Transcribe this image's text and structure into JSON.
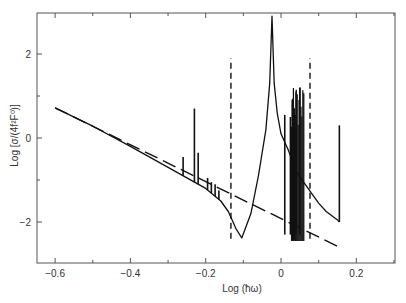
{
  "chart_data": {
    "type": "line",
    "title": "",
    "xlabel": "Log (ħω)",
    "ylabel": "Log [σ/(4f²F⁰)]",
    "xlim": [
      -0.65,
      0.3
    ],
    "ylim": [
      -3.0,
      3.0
    ],
    "x_ticks": [
      -0.6,
      -0.4,
      -0.2,
      0,
      0.2
    ],
    "x_tick_labels": [
      "−0.6",
      "−0.4",
      "−0.2",
      "0",
      "0.2"
    ],
    "y_ticks": [
      -2,
      0,
      2
    ],
    "y_tick_labels": [
      "−2",
      "0",
      "2"
    ],
    "grid": false,
    "legend": null,
    "series": [
      {
        "name": "cross-section (solid)",
        "style": "solid",
        "x": [
          -0.6,
          -0.5,
          -0.4,
          -0.3,
          -0.25,
          -0.2,
          -0.16,
          -0.14,
          -0.12,
          -0.104,
          -0.08,
          -0.06,
          -0.04,
          -0.03,
          -0.024,
          -0.018,
          -0.01,
          0.0,
          0.01,
          0.02,
          0.04,
          0.06,
          0.08,
          0.1,
          0.12,
          0.15,
          0.155
        ],
        "y": [
          0.72,
          0.28,
          -0.2,
          -0.7,
          -0.95,
          -1.2,
          -1.5,
          -1.75,
          -2.15,
          -2.38,
          -1.8,
          -0.9,
          0.2,
          1.3,
          2.9,
          1.3,
          0.6,
          0.1,
          -0.1,
          -0.3,
          -0.8,
          -1.05,
          -1.3,
          -1.55,
          -1.75,
          -1.95,
          -2.0
        ]
      },
      {
        "name": "power-law fit (long dash)",
        "style": "dashed",
        "x": [
          -0.6,
          0.155
        ],
        "y": [
          0.72,
          -2.6
        ]
      }
    ],
    "spikes": [
      {
        "x": -0.26,
        "y_top": -0.45
      },
      {
        "x": -0.23,
        "y_top": 0.7
      },
      {
        "x": -0.22,
        "y_top": -0.35
      },
      {
        "x": -0.195,
        "y_top": -0.95
      },
      {
        "x": -0.185,
        "y_top": -1.05
      },
      {
        "x": -0.175,
        "y_top": -1.1
      },
      {
        "x": -0.165,
        "y_top": -1.25
      },
      {
        "x": 0.01,
        "y_top": 0.55
      },
      {
        "x": 0.025,
        "y_top": 0.5
      },
      {
        "x": 0.03,
        "y_top": 0.9
      },
      {
        "x": 0.04,
        "y_top": 1.1
      },
      {
        "x": 0.05,
        "y_top": 1.2
      },
      {
        "x": 0.155,
        "y_top": 0.3
      }
    ],
    "annotations": [
      {
        "type": "vertical_dashed_line",
        "x": -0.133,
        "y_range": [
          -2.4,
          1.9
        ]
      },
      {
        "type": "vertical_dashed_line",
        "x": 0.077,
        "y_range": [
          -2.4,
          1.9
        ]
      }
    ]
  }
}
